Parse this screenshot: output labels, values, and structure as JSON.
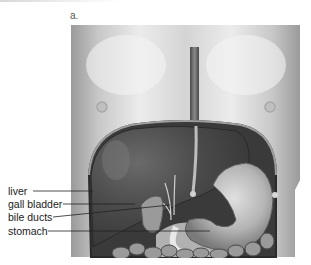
{
  "figure": {
    "panel_letter": "a.",
    "labels": [
      {
        "text": "liver",
        "y": 191
      },
      {
        "text": "gall bladder",
        "y": 204
      },
      {
        "text": "bile ducts",
        "y": 217
      },
      {
        "text": "stomach",
        "y": 231
      }
    ]
  }
}
